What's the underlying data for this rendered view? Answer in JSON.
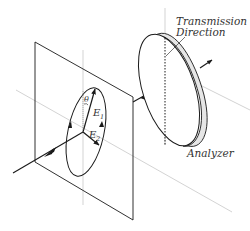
{
  "diagram": {
    "labels": {
      "transmission_line1": "Transmission",
      "transmission_line2": "Direction",
      "analyzer": "Analyzer",
      "e1_base": "E",
      "e1_sub": "1",
      "e2_base": "E",
      "e2_sub": "2",
      "theta": "θ"
    },
    "colors": {
      "line": "#1a1a1a",
      "axis": "#c8c8c8",
      "analyzer_rim": "#e6e6e6",
      "text": "#333333"
    }
  }
}
